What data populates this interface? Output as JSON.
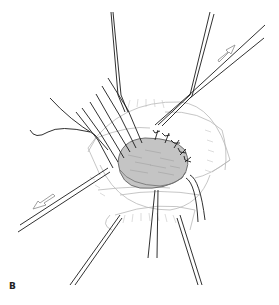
{
  "figure": {
    "panel_label": "B",
    "colors": {
      "line": "#1a1a1a",
      "faint_line": "#b5b5b5",
      "graft_fill": "#c4c4c4",
      "graft_stroke": "#6f6f6f",
      "arrow_fill": "#ffffff",
      "arrow_stroke": "#888888"
    },
    "arrows": [
      {
        "name": "retraction-arrow-upper-right",
        "direction": "up-right"
      },
      {
        "name": "retraction-arrow-lower-left",
        "direction": "down-left"
      }
    ]
  }
}
